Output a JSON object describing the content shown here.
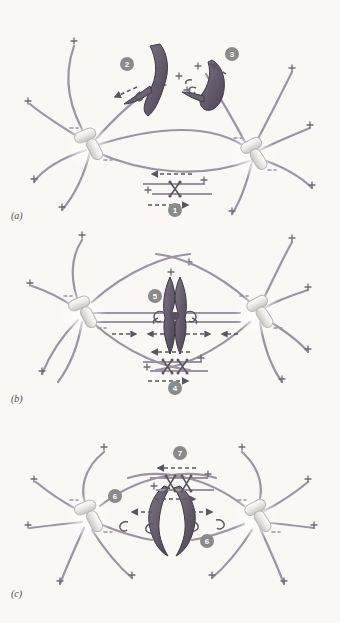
{
  "figure": {
    "background_color": "#faf8f5",
    "microtubule_color": "#9d93a3",
    "chromosome_color": "#6b6270",
    "chromosome_shade": "#4f4857",
    "centrosome_color": "#e8e6e4",
    "centrosome_outline": "#b9b5b2",
    "badge_color": "#8a8a8a",
    "badge_text_color": "#ffffff",
    "arrow_color": "#5a5560",
    "plus_color": "#6f6a72"
  },
  "panels": [
    {
      "id": "a",
      "label": "(a)",
      "stage": "prometaphase",
      "label_x": 11,
      "label_y": 210,
      "centrosomes": [
        {
          "name": "left-centrosome",
          "cx": 88,
          "cy": 145
        },
        {
          "name": "right-centrosome",
          "cx": 252,
          "cy": 155
        }
      ],
      "steps": [
        {
          "n": "1",
          "x": 175,
          "y": 210,
          "description": "antiparallel sliding of interpolar microtubules by bipolar motor"
        },
        {
          "n": "2",
          "x": 127,
          "y": 64,
          "description": "chromosome pushed away by polar ejection force"
        },
        {
          "n": "3",
          "x": 232,
          "y": 54,
          "description": "kinetochore captured and pulled toward pole"
        }
      ],
      "chromosomes": [
        {
          "name": "chromosome-left",
          "shape": "bent-v"
        },
        {
          "name": "chromosome-right",
          "shape": "hook"
        }
      ]
    },
    {
      "id": "b",
      "label": "(b)",
      "stage": "metaphase",
      "label_x": 11,
      "label_y": 393,
      "centrosomes": [
        {
          "name": "left-centrosome",
          "cx": 80,
          "cy": 312
        },
        {
          "name": "right-centrosome",
          "cx": 260,
          "cy": 312
        }
      ],
      "steps": [
        {
          "n": "4",
          "x": 175,
          "y": 382,
          "description": "interpolar microtubule sliding maintains spindle length"
        },
        {
          "n": "5",
          "x": 157,
          "y": 296,
          "description": "balanced kinetochore forces align chromosome at metaphase plate"
        }
      ],
      "chromosomes": [
        {
          "name": "metaphase-chromosome",
          "shape": "vertical-x"
        }
      ]
    },
    {
      "id": "c",
      "label": "(c)",
      "stage": "anaphase",
      "label_x": 11,
      "label_y": 588,
      "centrosomes": [
        {
          "name": "left-centrosome",
          "cx": 88,
          "cy": 516
        },
        {
          "name": "right-centrosome",
          "cx": 256,
          "cy": 516
        }
      ],
      "steps": [
        {
          "n": "6",
          "x": 115,
          "y": 496,
          "description": "anaphase A: kinetochore microtubules shorten pulling chromatids poleward"
        },
        {
          "n": "6",
          "x": 207,
          "y": 538,
          "description": "anaphase A: kinetochore microtubules shorten pulling chromatids poleward"
        },
        {
          "n": "7",
          "x": 180,
          "y": 453,
          "description": "anaphase B: interpolar microtubule sliding pushes poles apart"
        }
      ],
      "chromosomes": [
        {
          "name": "chromatid-left",
          "shape": "close-paren"
        },
        {
          "name": "chromatid-right",
          "shape": "open-paren"
        }
      ]
    }
  ],
  "legend": {
    "plus_end_symbol": "+",
    "plus_end_label": "plus end of microtubule",
    "motor_symbol": "X",
    "motor_label": "bipolar kinesin motor",
    "dashed_arrow_label": "direction of force / sliding"
  }
}
